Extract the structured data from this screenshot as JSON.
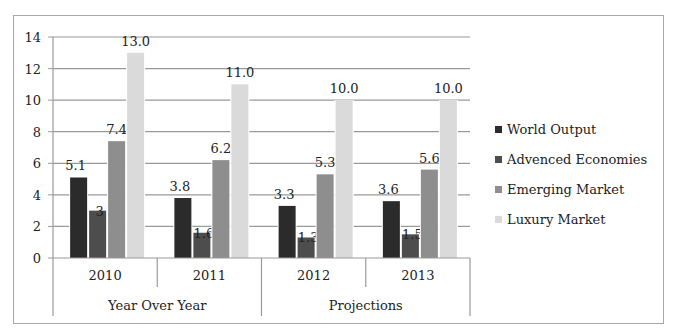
{
  "chart_data": {
    "type": "bar",
    "title": "",
    "xlabel": "",
    "ylabel": "",
    "ylim": [
      0,
      14
    ],
    "yticks": [
      0,
      2,
      4,
      6,
      8,
      10,
      12,
      14
    ],
    "grid": true,
    "legend_position": "right",
    "categories": [
      "2010",
      "2011",
      "2012",
      "2013"
    ],
    "category_groups": [
      {
        "label": "Year Over Year",
        "categories": [
          "2010",
          "2011"
        ]
      },
      {
        "label": "Projections",
        "categories": [
          "2012",
          "2013"
        ]
      }
    ],
    "series": [
      {
        "name": "World Output",
        "color": "#2b2b2b",
        "values": [
          5.1,
          3.8,
          3.3,
          3.6
        ],
        "labels": [
          "5.1",
          "3.8",
          "3.3",
          "3.6"
        ]
      },
      {
        "name": "Advenced Economies",
        "color": "#4d4d4d",
        "values": [
          3,
          1.6,
          1.3,
          1.5
        ],
        "labels": [
          "3",
          "1.6",
          "1.3",
          "1.5"
        ]
      },
      {
        "name": "Emerging Market",
        "color": "#8e8e8e",
        "values": [
          7.4,
          6.2,
          5.3,
          5.6
        ],
        "labels": [
          "7.4",
          "6.2",
          "5.3",
          "5.6"
        ]
      },
      {
        "name": "Luxury Market",
        "color": "#dadada",
        "values": [
          13.0,
          11.0,
          10.0,
          10.0
        ],
        "labels": [
          "13.0",
          "11.0",
          "10.0",
          "10.0"
        ]
      }
    ]
  },
  "legend": {
    "items": [
      {
        "label": "World Output",
        "color": "#2b2b2b"
      },
      {
        "label": "Advenced Economies",
        "color": "#4d4d4d"
      },
      {
        "label": "Emerging Market",
        "color": "#8e8e8e"
      },
      {
        "label": "Luxury Market",
        "color": "#dadada"
      }
    ]
  }
}
